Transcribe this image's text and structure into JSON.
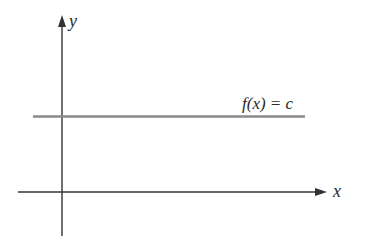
{
  "diagram": {
    "axes": {
      "x_label": "x",
      "y_label": "y"
    },
    "function_label": "f(x) = c",
    "colors": {
      "axis": "#333333",
      "function_line": "#8a8a8a",
      "text": "#2a2a2a",
      "background": "#ffffff"
    }
  }
}
